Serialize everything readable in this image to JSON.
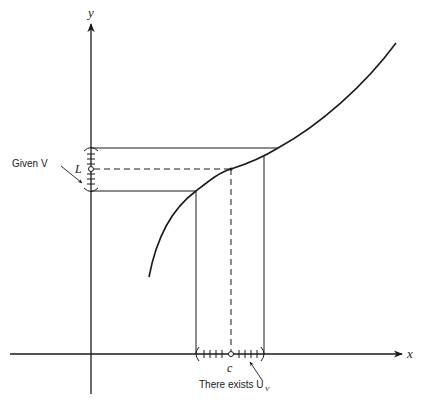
{
  "diagram": {
    "axes": {
      "x_label": "x",
      "y_label": "y"
    },
    "labels": {
      "L": "L",
      "c": "c",
      "given_v": "Given V",
      "there_exists": "There exists U",
      "there_exists_sub": "V"
    },
    "points": {
      "cL": {
        "x": 231,
        "y": 169
      }
    },
    "neighborhood_V": {
      "top_y": 148,
      "bottom_y": 191,
      "center_y": 169
    },
    "neighborhood_U": {
      "left_x": 196,
      "right_x": 264,
      "center_x": 231
    },
    "colors": {
      "ink": "#1a1a1a",
      "background": "#ffffff"
    }
  }
}
